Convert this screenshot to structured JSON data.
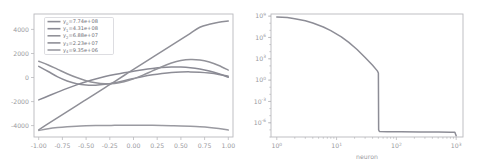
{
  "figure": {
    "background": "#ffffff",
    "panel_count": 2
  },
  "chart_data": [
    {
      "type": "line",
      "panel": "left",
      "title": "",
      "xlabel": "",
      "ylabel": "",
      "xlim": [
        -1.05,
        1.05
      ],
      "ylim": [
        -5100,
        5100
      ],
      "grid": false,
      "legend_position": "upper left",
      "xticks": [
        "-1.00",
        "-0.75",
        "-0.50",
        "-0.25",
        "0.00",
        "0.25",
        "0.50",
        "0.75",
        "1.00"
      ],
      "xtick_values": [
        -1.0,
        -0.75,
        -0.5,
        -0.25,
        0.0,
        0.25,
        0.5,
        0.75,
        1.0
      ],
      "yticks": [
        "4000",
        "2000",
        "0",
        "-2000",
        "-4000"
      ],
      "ytick_values": [
        4000,
        2000,
        0,
        -2000,
        -4000
      ],
      "x": [
        -1.0,
        -0.9,
        -0.8,
        -0.7,
        -0.6,
        -0.5,
        -0.4,
        -0.3,
        -0.2,
        -0.1,
        0.0,
        0.1,
        0.2,
        0.3,
        0.4,
        0.5,
        0.6,
        0.7,
        0.8,
        0.9,
        1.0
      ],
      "series": [
        {
          "name": "y0",
          "label_prefix": "y",
          "label_sub": "0",
          "label_value": "=7.74e+08",
          "label": "y0=7.74e+08",
          "color": "#8d8d96",
          "values": [
            760,
            330,
            -110,
            -450,
            -680,
            -790,
            -800,
            -730,
            -600,
            -430,
            -250,
            -80,
            60,
            170,
            250,
            290,
            300,
            270,
            200,
            90,
            -60
          ]
        },
        {
          "name": "y1",
          "label_prefix": "y",
          "label_sub": "1",
          "label_value": "=4.31e+08",
          "label": "y1=4.31e+08",
          "color": "#8a8a94",
          "values": [
            -2020,
            -1700,
            -1380,
            -1070,
            -780,
            -520,
            -290,
            -90,
            80,
            230,
            360,
            480,
            580,
            660,
            700,
            700,
            650,
            540,
            370,
            140,
            -150
          ]
        },
        {
          "name": "y2",
          "label_prefix": "y",
          "label_sub": "2",
          "label_value": "=6.88e+07",
          "label": "y2=6.88e+07",
          "color": "#929299",
          "values": [
            1180,
            870,
            510,
            150,
            -170,
            -430,
            -610,
            -690,
            -660,
            -520,
            -280,
            30,
            380,
            730,
            1030,
            1240,
            1330,
            1290,
            1120,
            830,
            450
          ]
        },
        {
          "name": "y3",
          "label_prefix": "y",
          "label_sub": "3",
          "label_value": "=2.23e+07",
          "label": "y3=2.23e+07",
          "color": "#8f8f97",
          "values": [
            -4500,
            -4000,
            -3500,
            -3000,
            -2500,
            -2000,
            -1500,
            -1000,
            -500,
            0,
            500,
            1000,
            1500,
            2000,
            2500,
            3000,
            3500,
            4000,
            4250,
            4420,
            4520
          ]
        },
        {
          "name": "y4",
          "label_prefix": "y",
          "label_sub": "4",
          "label_value": "=9.35e+06",
          "label": "y4=9.35e+06",
          "color": "#9a9aa1",
          "values": [
            -4560,
            -4420,
            -4320,
            -4250,
            -4200,
            -4170,
            -4150,
            -4140,
            -4135,
            -4130,
            -4128,
            -4130,
            -4135,
            -4145,
            -4160,
            -4180,
            -4210,
            -4250,
            -4310,
            -4400,
            -4520
          ]
        }
      ]
    },
    {
      "type": "line",
      "panel": "right",
      "title": "",
      "xlabel": "neuron",
      "ylabel": "",
      "xscale": "log",
      "yscale": "log",
      "grid": false,
      "xlim": [
        0.8,
        1300
      ],
      "ylim": [
        1e-08,
        2000000000.0
      ],
      "xticks": [
        "10^0",
        "10^1",
        "10^2",
        "10^3"
      ],
      "xtick_values": [
        1,
        10,
        100,
        1000
      ],
      "yticks": [
        "10^9",
        "10^6",
        "10^3",
        "10^0",
        "10^-3",
        "10^-6"
      ],
      "ytick_values": [
        1000000000.0,
        1000000.0,
        1000.0,
        1,
        0.001,
        1e-06
      ],
      "series": [
        {
          "name": "singular-values",
          "color": "#8d8d96",
          "x": [
            1,
            1.5,
            2,
            3,
            4,
            6,
            8,
            12,
            16,
            22,
            30,
            40,
            48,
            50,
            50.5,
            52,
            70,
            120,
            250,
            500,
            800,
            950,
            1000
          ],
          "values": [
            774000000.0,
            650000000.0,
            431000000.0,
            220000000.0,
            110000000.0,
            30000000.0,
            9000000.0,
            1200000.0,
            200000.0,
            20000.0,
            1500.0,
            120.0,
            20.0,
            10.0,
            1e-07,
            6e-08,
            5.6e-08,
            5.4e-08,
            5.2e-08,
            5e-08,
            4.8e-08,
            4.6e-08,
            1.5e-08
          ]
        }
      ]
    }
  ]
}
